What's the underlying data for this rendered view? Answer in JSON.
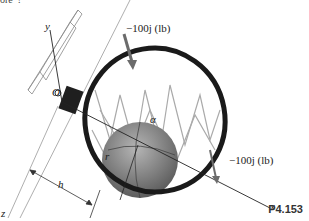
{
  "figure": {
    "caption": "P4.153",
    "top_cropped_text": "ore”?",
    "labels": {
      "force_top": "−100j (lb)",
      "force_right": "−100j (lb)",
      "axis_x": "x",
      "axis_y": "y",
      "axis_z": "z",
      "origin": "O",
      "angle": "α",
      "radius": "r",
      "distance": "h"
    },
    "colors": {
      "rim": "#1a1a1a",
      "ball": "#7a7a7a",
      "arrow": "#6b6b6b",
      "net": "#bbbbbb",
      "background": "#ffffff"
    }
  }
}
